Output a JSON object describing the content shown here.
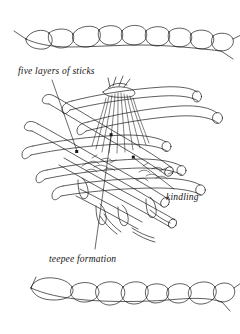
{
  "figure": {
    "type": "line-illustration",
    "background_color": "#ffffff",
    "ink_color": "#1a1a1a",
    "labels": [
      {
        "id": "five-layers",
        "text": "five layers of sticks",
        "x": 18,
        "y": 66,
        "leader_from": [
          52,
          80
        ],
        "leader_to": [
          77,
          152
        ]
      },
      {
        "id": "kindling",
        "text": "kindling",
        "x": 166,
        "y": 192,
        "leader_from": [
          175,
          189
        ],
        "leader_to": [
          133,
          157
        ]
      },
      {
        "id": "teepee",
        "text": "teepee formation",
        "x": 49,
        "y": 254,
        "leader_from": [
          95,
          250
        ],
        "leader_to": [
          111,
          134
        ]
      }
    ],
    "borders": {
      "top_rope": {
        "y": 36,
        "x_start": 18,
        "x_end": 228,
        "links": 9
      },
      "bottom_rope": {
        "y": 296,
        "x_start": 18,
        "x_end": 228,
        "links": 9
      }
    }
  }
}
